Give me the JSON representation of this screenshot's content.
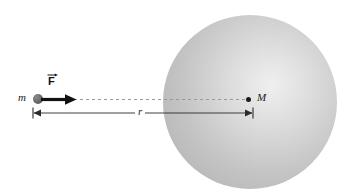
{
  "figure": {
    "background_color": "#ffffff"
  },
  "labels": {
    "small_mass": "m",
    "large_mass": "M",
    "distance": "r",
    "force": "F"
  },
  "objects": {
    "sphere": {
      "name": "large-mass-sphere",
      "center_x": 250,
      "center_y": 102,
      "radius": 87,
      "fill_light": "#efefef",
      "fill_dark": "#b6b6b6"
    },
    "particle": {
      "name": "small-mass-particle",
      "center_x": 38,
      "center_y": 99,
      "radius": 5,
      "color": "#6e6e6e"
    },
    "center_dot": {
      "name": "sphere-center-dot",
      "center_x": 249,
      "center_y": 100,
      "radius": 2.5,
      "color": "#1a1a1a"
    },
    "force_arrow": {
      "name": "force-vector-arrow",
      "from_x": 41,
      "to_x": 77,
      "y": 99,
      "color": "#111111"
    },
    "dashed_line": {
      "name": "line-of-action",
      "from_x": 74,
      "to_x": 250,
      "y": 99,
      "color": "#9a9a9a"
    },
    "dimension_line": {
      "name": "distance-dimension-line",
      "from_x": 34,
      "to_x": 252,
      "y": 113,
      "color": "#2b2b2b"
    }
  }
}
